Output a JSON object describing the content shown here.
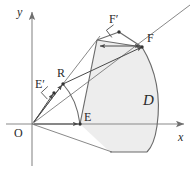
{
  "figure": {
    "background": "#ffffff",
    "region_fill": "#ededed",
    "stroke_color": "#5a5a5a",
    "axis_color": "#8a8a8a",
    "label_color": "#2b2b2b"
  },
  "axes": {
    "x_label": "x",
    "y_label": "y",
    "origin_label": "O",
    "x_axis": {
      "x1": 6,
      "y1": 124,
      "x2": 184,
      "y2": 124
    },
    "y_axis": {
      "x1": 32,
      "y1": 166,
      "x2": 32,
      "y2": 12
    }
  },
  "points": [
    {
      "name": "O",
      "label": "O",
      "x": 32,
      "y": 124,
      "label_x": 14,
      "label_y": 126,
      "dot": false
    },
    {
      "name": "E",
      "label": "E",
      "x": 80,
      "y": 124,
      "label_x": 84,
      "label_y": 113,
      "dot": true
    },
    {
      "name": "R",
      "label": "R",
      "x": 63,
      "y": 84,
      "label_x": 57,
      "label_y": 68,
      "dot": true
    },
    {
      "name": "Eprime",
      "label": "E′",
      "x": 54,
      "y": 93,
      "label_x": 36,
      "label_y": 80,
      "dot": true
    },
    {
      "name": "F",
      "label": "F",
      "x": 142,
      "y": 47,
      "label_x": 146,
      "label_y": 33,
      "dot": true
    },
    {
      "name": "Fprime",
      "label": "F′",
      "x": 119,
      "y": 32,
      "label_x": 110,
      "label_y": 14,
      "dot": true
    }
  ],
  "region": {
    "name": "D",
    "label": "D",
    "label_x": 145,
    "label_y": 100,
    "outline_path": "M 80,124 L 97,40 L 142,47 C 156,70 160,100 156,128 C 154,140 150,148 146,152 L 110,152 Z",
    "fill_path": "M 80,124 L 97,40 L 142,47 C 155,66 161,96 157,126 C 155,139 151,148 147,152 L 110,152 Z"
  },
  "arc_ER": {
    "description": "small circular arc from E up to R centred at O",
    "path": "M 80,124 C 78,108 72,94 63,84"
  },
  "arc_right": {
    "description": "large circular arc boundary of D from F down past the x axis",
    "path": "M 142,47 C 156,70 161,98 157,126 C 155,140 151,148 147,152"
  },
  "rays": [
    {
      "name": "ray-O-E-down",
      "description": "ray through O and E continuing below axis",
      "x1": 32,
      "y1": 124,
      "x2": 112,
      "y2": 152
    },
    {
      "name": "ray-O-R-F",
      "description": "ray from O through R to F-prime and beyond",
      "x1": 32,
      "y1": 124,
      "x2": 190,
      "y2": 5
    },
    {
      "name": "ray-O-Eprime",
      "description": "ray from O through E-prime",
      "x1": 32,
      "y1": 124,
      "x2": 100,
      "y2": 36
    }
  ],
  "segments": [
    {
      "name": "seg-upper-chord",
      "description": "top edge of wedge from apex to F",
      "x1": 97,
      "y1": 40,
      "x2": 142,
      "y2": 47
    },
    {
      "name": "seg-E-to-apex",
      "description": "left edge of wedge from E upward",
      "x1": 80,
      "y1": 124,
      "x2": 97,
      "y2": 40
    },
    {
      "name": "seg-Fprime-F",
      "description": "segment from F-prime to F",
      "x1": 119,
      "y1": 32,
      "x2": 142,
      "y2": 47
    },
    {
      "name": "seg-Fprime-apex",
      "description": "segment from F-prime down to wedge apex",
      "x1": 119,
      "y1": 32,
      "x2": 97,
      "y2": 40
    },
    {
      "name": "seg-bottom",
      "description": "bottom straight edge of region",
      "x1": 110,
      "y1": 152,
      "x2": 147,
      "y2": 152
    }
  ],
  "arrows": [
    {
      "name": "arrow-R-to-F",
      "description": "arrow from R to F",
      "x1": 63,
      "y1": 84,
      "x2": 142,
      "y2": 47,
      "heads": "end"
    },
    {
      "name": "arrow-apex-to-F",
      "description": "double arrow along top chord",
      "x1": 100,
      "y1": 46,
      "x2": 140,
      "y2": 46,
      "heads": "both"
    },
    {
      "name": "arrow-O-to-E",
      "description": "arrow from O to E along x-axis",
      "x1": 34,
      "y1": 124,
      "x2": 78,
      "y2": 124,
      "heads": "end"
    },
    {
      "name": "arrow-O-to-R",
      "description": "arrow from O toward R",
      "x1": 34,
      "y1": 122,
      "x2": 62,
      "y2": 85,
      "heads": "end"
    },
    {
      "name": "arrow-O-to-Eprime",
      "description": "arrow from O toward E-prime",
      "x1": 34,
      "y1": 122,
      "x2": 53,
      "y2": 94,
      "heads": "end"
    }
  ],
  "right_angles": [
    {
      "name": "right-angle-at-Eprime",
      "x": 54,
      "y": 93,
      "size": 9,
      "rotation": -43
    },
    {
      "name": "right-angle-at-Fprime",
      "x": 119,
      "y": 32,
      "size": 9,
      "rotation": -37
    }
  ]
}
